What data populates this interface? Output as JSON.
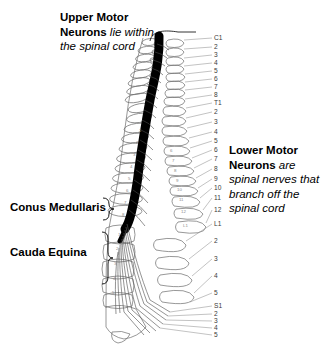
{
  "figure": {
    "background_color": "#ffffff",
    "cord_color": "#000000",
    "bone_outline_color": "#6b6b6b",
    "leader_line_color": "#9a9a9a",
    "label_text_color": "#3a3a3a"
  },
  "annotations": {
    "upper_motor": {
      "bold": "Upper Motor Neurons",
      "italic": "lie within the spinal cord",
      "line1_bold": "Upper Motor",
      "line2_bold": "Neurons",
      "line2_italic": "lie within",
      "line3_italic": "the spinal cord"
    },
    "lower_motor": {
      "bold": "Lower Motor Neurons",
      "italic": "are spinal nerves that branch off the spinal cord",
      "line1_bold": "Lower Motor",
      "line2_bold": "Neurons",
      "line2_italic": "are",
      "line3_italic": "spinal nerves that",
      "line4_italic": "branch off the",
      "line5_italic": "spinal cord"
    },
    "conus_medullaris": "Conus Medullaris",
    "cauda_equina": "Cauda Equina"
  },
  "segments": [
    {
      "label": "C1",
      "y": 38
    },
    {
      "label": "2",
      "y": 47
    },
    {
      "label": "3",
      "y": 55
    },
    {
      "label": "4",
      "y": 63
    },
    {
      "label": "5",
      "y": 71
    },
    {
      "label": "6",
      "y": 79
    },
    {
      "label": "7",
      "y": 87
    },
    {
      "label": "8",
      "y": 95
    },
    {
      "label": "T1",
      "y": 103
    },
    {
      "label": "2",
      "y": 112
    },
    {
      "label": "3",
      "y": 122
    },
    {
      "label": "4",
      "y": 132
    },
    {
      "label": "5",
      "y": 141
    },
    {
      "label": "6",
      "y": 150
    },
    {
      "label": "7",
      "y": 159
    },
    {
      "label": "8",
      "y": 169
    },
    {
      "label": "9",
      "y": 179
    },
    {
      "label": "10",
      "y": 188
    },
    {
      "label": "11",
      "y": 198
    },
    {
      "label": "12",
      "y": 210
    },
    {
      "label": "L1",
      "y": 224
    },
    {
      "label": "2",
      "y": 241
    },
    {
      "label": "3",
      "y": 259
    },
    {
      "label": "4",
      "y": 276
    },
    {
      "label": "5",
      "y": 293
    },
    {
      "label": "S1",
      "y": 306
    },
    {
      "label": "2",
      "y": 314
    },
    {
      "label": "3",
      "y": 321
    },
    {
      "label": "4",
      "y": 328
    },
    {
      "label": "5",
      "y": 335
    }
  ],
  "vertebral_body_numbers": [
    {
      "label": "1",
      "x": 139,
      "y": 130
    },
    {
      "label": "2",
      "x": 136,
      "y": 142
    },
    {
      "label": "3",
      "x": 133,
      "y": 154
    },
    {
      "label": "4",
      "x": 130,
      "y": 166
    },
    {
      "label": "5",
      "x": 128,
      "y": 178
    },
    {
      "label": "6",
      "x": 126,
      "y": 190
    },
    {
      "label": "7",
      "x": 124,
      "y": 202
    },
    {
      "label": "8",
      "x": 122,
      "y": 214
    }
  ],
  "spinous_numbers": [
    {
      "label": "6",
      "x": 170,
      "y": 150
    },
    {
      "label": "7",
      "x": 172,
      "y": 160
    },
    {
      "label": "8",
      "x": 174,
      "y": 170
    },
    {
      "label": "9",
      "x": 176,
      "y": 180
    },
    {
      "label": "10",
      "x": 177,
      "y": 189
    },
    {
      "label": "11",
      "x": 179,
      "y": 199
    },
    {
      "label": "12",
      "x": 181,
      "y": 211
    },
    {
      "label": "L1",
      "x": 183,
      "y": 225
    }
  ],
  "lumbar_numbers": [
    {
      "label": "1",
      "x": 118,
      "y": 234
    },
    {
      "label": "2",
      "x": 116,
      "y": 248
    },
    {
      "label": "3",
      "x": 114,
      "y": 263
    },
    {
      "label": "4",
      "x": 113,
      "y": 278
    },
    {
      "label": "5",
      "x": 112,
      "y": 292
    }
  ]
}
